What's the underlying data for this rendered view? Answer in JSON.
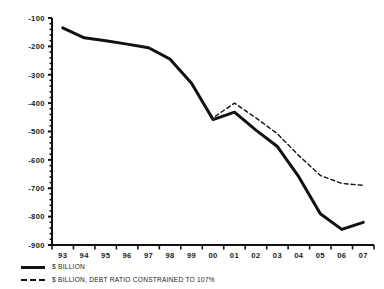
{
  "chart_data": {
    "type": "line",
    "title": "",
    "subtitle": "",
    "xlabel": "",
    "ylabel": "",
    "x": [
      "93",
      "94",
      "95",
      "96",
      "97",
      "98",
      "99",
      "00",
      "01",
      "02",
      "03",
      "04",
      "05",
      "06",
      "07"
    ],
    "categories": [
      "93",
      "94",
      "95",
      "96",
      "97",
      "98",
      "99",
      "00",
      "01",
      "02",
      "03",
      "04",
      "05",
      "06",
      "07"
    ],
    "ylim": [
      -900,
      -100
    ],
    "xlim_labels": [
      "93",
      "07"
    ],
    "ytick_labels": [
      "-100",
      "-200",
      "-300",
      "-400",
      "-500",
      "-600",
      "-700",
      "-800",
      "-900"
    ],
    "ytick_values": [
      -100,
      -200,
      -300,
      -400,
      -500,
      -600,
      -700,
      -800,
      -900
    ],
    "minor_ticks_per_interval": 5,
    "grid": false,
    "legend_position": "below-left",
    "series": [
      {
        "name": "$ BILLION",
        "style": "solid",
        "color": "#111111",
        "width": 3,
        "values": [
          -135,
          -170,
          -180,
          -192,
          -205,
          -245,
          -330,
          -458,
          -432,
          -495,
          -553,
          -660,
          -790,
          -845,
          -820
        ]
      },
      {
        "name": "$ BILLION, DEBT RATIO CONSTRAINED TO 107%",
        "style": "dashed",
        "color": "#111111",
        "width": 1.4,
        "values": [
          -135,
          -170,
          -180,
          -192,
          -205,
          -245,
          -330,
          -452,
          -400,
          -452,
          -508,
          -585,
          -655,
          -683,
          -690
        ]
      }
    ]
  },
  "legend": {
    "items": [
      {
        "label": "$ BILLION",
        "marker": "solid-line-swatch"
      },
      {
        "label": "$ BILLION, DEBT RATIO CONSTRAINED TO 107%",
        "marker": "dashed-line-swatch"
      }
    ]
  },
  "axes": {
    "y_axis_name": "value-axis",
    "x_axis_name": "year-axis"
  }
}
